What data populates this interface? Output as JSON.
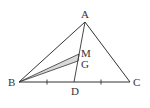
{
  "diagram": {
    "points": {
      "A": {
        "x": 85,
        "y": 22,
        "label": "A",
        "lx": 81,
        "ly": 18
      },
      "B": {
        "x": 19,
        "y": 82,
        "label": "B",
        "lx": 8,
        "ly": 86
      },
      "C": {
        "x": 130,
        "y": 82,
        "label": "C",
        "lx": 133,
        "ly": 86
      },
      "D": {
        "x": 74,
        "y": 82,
        "label": "D",
        "lx": 71,
        "ly": 95
      },
      "M": {
        "x": 79,
        "y": 54,
        "label": "M",
        "lx": 81,
        "ly": 57
      },
      "G": {
        "x": 78,
        "y": 61,
        "label": "G",
        "lx": 81,
        "ly": 68
      }
    },
    "segments": [
      "AB",
      "AC",
      "BC",
      "AD",
      "BM",
      "BG"
    ],
    "shaded_region": "BMG",
    "tick_marks": [
      {
        "x": 47,
        "y": 82
      },
      {
        "x": 101,
        "y": 82
      }
    ],
    "colors": {
      "stroke": "#333333",
      "shade": "#d9d9d9",
      "background": "#ffffff"
    }
  }
}
